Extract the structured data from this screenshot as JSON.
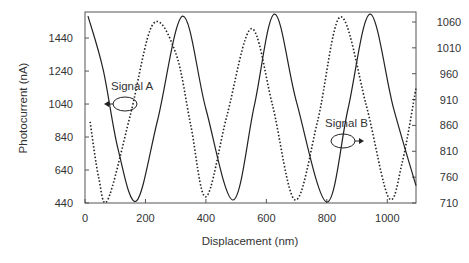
{
  "chart_data": {
    "type": "line",
    "title": "",
    "xlabel": "Displacement (nm)",
    "ylabel": "Photocurrent (nA)",
    "y2label": "",
    "xlim": [
      0,
      1095
    ],
    "ylim": [
      440,
      1598
    ],
    "y2lim": [
      710,
      1060
    ],
    "x_ticks": [
      0,
      200,
      400,
      600,
      800,
      1000
    ],
    "y_ticks": [
      440,
      640,
      840,
      1040,
      1240,
      1440
    ],
    "y2_ticks": [
      710,
      760,
      810,
      860,
      910,
      960,
      1010,
      1060
    ],
    "grid": false,
    "legend": "none (inline annotations)",
    "annotations": [
      {
        "text": "Signal A",
        "points_to": "left axis",
        "x": 128,
        "y": 1040
      },
      {
        "text": "Signal B",
        "points_to": "right axis",
        "x": 830,
        "y": 870
      }
    ],
    "series": [
      {
        "name": "Signal A",
        "axis": "left",
        "style": "solid",
        "x": [
          10,
          60,
          110,
          170,
          240,
          323,
          400,
          490,
          560,
          627,
          700,
          800,
          870,
          943,
          1020,
          1095
        ],
        "values": [
          1573,
          1250,
          760,
          452,
          940,
          1573,
          1010,
          458,
          1030,
          1585,
          1050,
          446,
          1010,
          1585,
          1020,
          545
        ]
      },
      {
        "name": "Signal B",
        "axis": "right",
        "style": "dotted",
        "x": [
          17,
          45,
          75,
          150,
          225,
          300,
          350,
          400,
          470,
          550,
          620,
          695,
          770,
          845,
          930,
          1005,
          1050,
          1095
        ],
        "values": [
          867,
          760,
          716,
          880,
          1056,
          1000,
          860,
          722,
          880,
          1047,
          900,
          716,
          870,
          1070,
          900,
          720,
          790,
          932
        ]
      }
    ]
  },
  "axes": {
    "xlabel": "Displacement (nm)",
    "ylabel": "Photocurrent (nA)",
    "x_tick_labels": [
      "0",
      "200",
      "400",
      "600",
      "800",
      "1000"
    ],
    "y_tick_labels": [
      "440",
      "640",
      "840",
      "1040",
      "1240",
      "1440"
    ],
    "y2_tick_labels": [
      "710",
      "760",
      "810",
      "860",
      "910",
      "960",
      "1010",
      "1060"
    ]
  },
  "annotations": {
    "signal_a": "Signal A",
    "signal_b": "Signal B"
  },
  "colors": {
    "line": "#222222",
    "frame": "#555555",
    "text": "#333333"
  }
}
